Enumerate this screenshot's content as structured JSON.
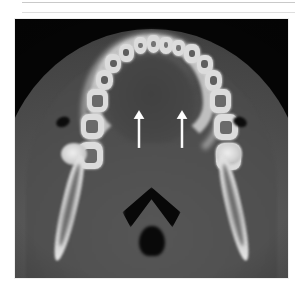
{
  "figure": {
    "modality": "axial-ct",
    "region": "mandible-dental-arch",
    "frame": {
      "x": 15,
      "y": 19,
      "width": 273,
      "height": 259
    },
    "background_color": "#050505",
    "soft_tissue_color": "#4f4f4f",
    "bone_color": "#dcdcdc",
    "annotation_color": "#ffffff"
  },
  "page_rules": [
    {
      "name": "rule-top",
      "y": 2,
      "color": "#c9c9c9"
    },
    {
      "name": "rule-second",
      "y": 12,
      "color": "#dedede"
    }
  ],
  "annotations": {
    "arrows": [
      {
        "name": "arrow-left",
        "x": 117,
        "y": 91,
        "length": 38,
        "direction": "up",
        "color": "#ffffff"
      },
      {
        "name": "arrow-right",
        "x": 160,
        "y": 91,
        "length": 38,
        "direction": "up",
        "color": "#ffffff"
      }
    ]
  },
  "anatomy": {
    "teeth_upper_arch": [
      {
        "name": "tooth-incisor-left-2",
        "left": 43.5,
        "top": 7.0,
        "w": 5.0,
        "h": 6.5,
        "type": "incisor"
      },
      {
        "name": "tooth-incisor-left-1",
        "left": 48.2,
        "top": 6.2,
        "w": 5.0,
        "h": 6.8,
        "type": "incisor"
      },
      {
        "name": "tooth-incisor-right-1",
        "left": 52.9,
        "top": 6.8,
        "w": 5.0,
        "h": 6.6,
        "type": "incisor"
      },
      {
        "name": "tooth-incisor-right-2",
        "left": 57.4,
        "top": 8.0,
        "w": 5.0,
        "h": 6.4,
        "type": "incisor"
      },
      {
        "name": "tooth-canine-left",
        "left": 38.0,
        "top": 9.5,
        "w": 5.6,
        "h": 7.0,
        "type": "canine"
      },
      {
        "name": "tooth-canine-right",
        "left": 62.0,
        "top": 9.8,
        "w": 5.6,
        "h": 7.0,
        "type": "canine"
      },
      {
        "name": "tooth-premolar-left-1",
        "left": 33.0,
        "top": 13.5,
        "w": 6.0,
        "h": 7.4,
        "type": "premolar"
      },
      {
        "name": "tooth-premolar-right-1",
        "left": 66.5,
        "top": 13.8,
        "w": 6.0,
        "h": 7.4,
        "type": "premolar"
      },
      {
        "name": "tooth-premolar-left-2",
        "left": 29.5,
        "top": 19.5,
        "w": 6.4,
        "h": 8.0,
        "type": "premolar"
      },
      {
        "name": "tooth-premolar-right-2",
        "left": 69.5,
        "top": 19.8,
        "w": 6.4,
        "h": 8.0,
        "type": "premolar"
      },
      {
        "name": "tooth-molar-left-1",
        "left": 26.5,
        "top": 27.0,
        "w": 7.6,
        "h": 9.0,
        "type": "molar"
      },
      {
        "name": "tooth-molar-right-1",
        "left": 71.5,
        "top": 27.2,
        "w": 7.6,
        "h": 9.0,
        "type": "molar"
      },
      {
        "name": "tooth-molar-left-2",
        "left": 24.0,
        "top": 36.5,
        "w": 8.6,
        "h": 10.0,
        "type": "molar"
      },
      {
        "name": "tooth-molar-right-2",
        "left": 73.0,
        "top": 36.8,
        "w": 8.6,
        "h": 10.0,
        "type": "molar"
      },
      {
        "name": "tooth-molar-left-3",
        "left": 23.0,
        "top": 47.5,
        "w": 9.2,
        "h": 10.5,
        "type": "molar"
      },
      {
        "name": "tooth-molar-right-3",
        "left": 73.5,
        "top": 47.8,
        "w": 9.2,
        "h": 10.5,
        "type": "molar"
      }
    ]
  }
}
